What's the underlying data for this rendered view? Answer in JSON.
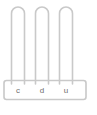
{
  "figure": {
    "name": "place-value-abacus",
    "stroke_color": "#c9c9c9",
    "label_color": "#6e6e6e",
    "background_color": "#ffffff",
    "columns": [
      {
        "key": "c",
        "label": "c",
        "meaning": "centenas"
      },
      {
        "key": "d",
        "label": "d",
        "meaning": "dezenas"
      },
      {
        "key": "u",
        "label": "u",
        "meaning": "unidades"
      }
    ],
    "base": {
      "label": "base-bar"
    },
    "caption": {
      "text": "",
      "visible": false
    }
  }
}
